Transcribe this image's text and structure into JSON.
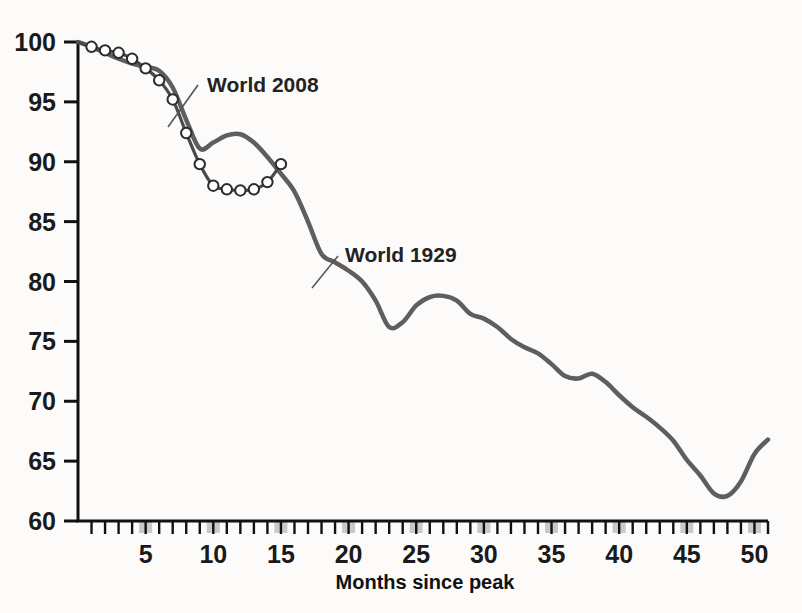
{
  "chart_data": {
    "type": "line",
    "title": "",
    "xlabel": "Months since peak",
    "ylabel": "",
    "xlim": [
      0,
      51
    ],
    "ylim": [
      60,
      100
    ],
    "grid": false,
    "legend_position": "inline-annotations",
    "x_ticks_major": [
      5,
      10,
      15,
      20,
      25,
      30,
      35,
      40,
      45,
      50
    ],
    "x_tick_labels": [
      "5",
      "10",
      "15",
      "20",
      "25",
      "30",
      "35",
      "40",
      "45",
      "50"
    ],
    "x_tick_minor_step": 1,
    "y_ticks": [
      60,
      65,
      70,
      75,
      80,
      85,
      90,
      95,
      100
    ],
    "y_tick_labels": [
      "60",
      "65",
      "70",
      "75",
      "80",
      "85",
      "90",
      "95",
      "100"
    ],
    "series": [
      {
        "name": "World 1929",
        "label": "World 1929",
        "color": "#5e5e5e",
        "marker": "none",
        "x": [
          0,
          1,
          2,
          3,
          4,
          5,
          6,
          7,
          8,
          9,
          10,
          11,
          12,
          13,
          14,
          15,
          16,
          17,
          18,
          19,
          20,
          21,
          22,
          23,
          24,
          25,
          26,
          27,
          28,
          29,
          30,
          31,
          32,
          33,
          34,
          35,
          36,
          37,
          38,
          39,
          40,
          41,
          42,
          43,
          44,
          45,
          46,
          47,
          48,
          49,
          50,
          51
        ],
        "y": [
          100.0,
          99.6,
          99.1,
          98.6,
          98.2,
          97.9,
          97.6,
          96.2,
          93.5,
          91.1,
          91.6,
          92.2,
          92.3,
          91.6,
          90.4,
          89.0,
          87.5,
          85.0,
          82.3,
          81.6,
          80.9,
          80.0,
          78.4,
          76.2,
          76.6,
          78.0,
          78.7,
          78.8,
          78.4,
          77.3,
          76.9,
          76.2,
          75.2,
          74.5,
          74.0,
          73.1,
          72.1,
          71.9,
          72.3,
          71.6,
          70.5,
          69.5,
          68.7,
          67.8,
          66.7,
          65.1,
          63.8,
          62.3,
          62.1,
          63.3,
          65.6,
          66.8
        ]
      },
      {
        "name": "World 2008",
        "label": "World 2008",
        "color": "#4a4a4a",
        "marker": "circle-open",
        "x": [
          0,
          1,
          2,
          3,
          4,
          5,
          6,
          7,
          8,
          9,
          10,
          11,
          12,
          13,
          14,
          15
        ],
        "y": [
          100.0,
          99.6,
          99.3,
          99.1,
          98.6,
          97.8,
          96.8,
          95.2,
          92.4,
          89.8,
          88.0,
          87.7,
          87.6,
          87.7,
          88.3,
          89.8
        ]
      }
    ],
    "annotations": [
      {
        "text": "World 2008",
        "x_px": 207,
        "y_px": 92
      },
      {
        "text": "World 1929",
        "x_px": 345,
        "y_px": 262
      }
    ]
  },
  "colors": {
    "line_1929": "#5e5e5e",
    "line_2008": "#4a4a4a",
    "axis": "#111111",
    "text": "#1a1a1a",
    "tick_highlight": "#c9c9c9",
    "background": "#fcfbfa",
    "marker_fill": "#ffffff"
  },
  "axis": {
    "x_title": "Months since peak"
  }
}
